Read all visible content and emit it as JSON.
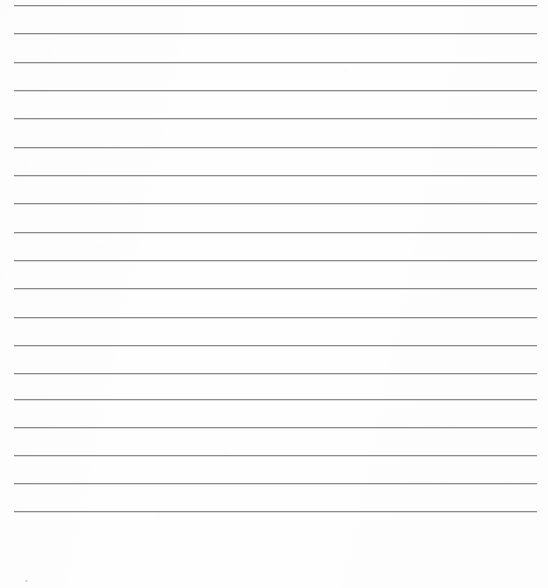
{
  "document": {
    "kind": "scanned-ruled-paper",
    "description": "Blank lined notebook page scan with no handwriting or printed text",
    "page_width": 548,
    "page_height": 588,
    "paper_color": "#fefefe",
    "has_text_content": false
  },
  "rules": {
    "line_color": "#8a8a8a",
    "line_thickness": 1,
    "line_count": 18,
    "left_margin": 14,
    "right_margin": 11,
    "line_left_x": 14,
    "line_width": 523,
    "first_line_y": 5,
    "line_spacing": 28.4,
    "last_line_y": 511,
    "y_positions": [
      5,
      33,
      62,
      90,
      118,
      147,
      175,
      203,
      232,
      260,
      288,
      317,
      345,
      373,
      399,
      427,
      455,
      483,
      511
    ]
  },
  "blank_footer": {
    "top_y": 512,
    "height": 76
  },
  "artifacts": {
    "speck": {
      "x": 25,
      "y": 580
    }
  }
}
